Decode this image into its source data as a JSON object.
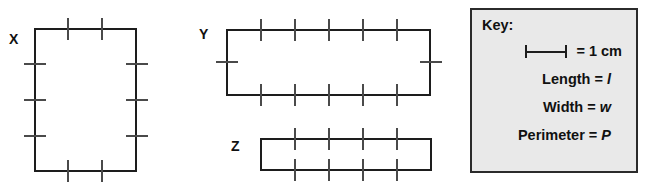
{
  "figures": [
    {
      "label": "X",
      "shape": "rectangle",
      "width_units": 3,
      "height_units": 4,
      "orientation": "portrait"
    },
    {
      "label": "Y",
      "shape": "rectangle",
      "width_units": 6,
      "height_units": 2,
      "orientation": "landscape"
    },
    {
      "label": "Z",
      "shape": "rectangle",
      "width_units": 5,
      "height_units": 1,
      "orientation": "landscape"
    }
  ],
  "key": {
    "title": "Key:",
    "scale": {
      "icon": "scale-bar-icon",
      "equals_text": "= 1 cm",
      "unit": "cm",
      "value": 1
    },
    "rows": [
      {
        "term": "Length = ",
        "variable": "l"
      },
      {
        "term": "Width = ",
        "variable": "w"
      },
      {
        "term": "Perimeter = ",
        "variable": "P"
      }
    ]
  },
  "colors": {
    "stroke": "#1d1d1d",
    "tick": "#4a4a4a",
    "key_background": "#e9e9e9",
    "key_border": "#2b2b2b",
    "text": "#111111",
    "page_background": "#ffffff"
  }
}
